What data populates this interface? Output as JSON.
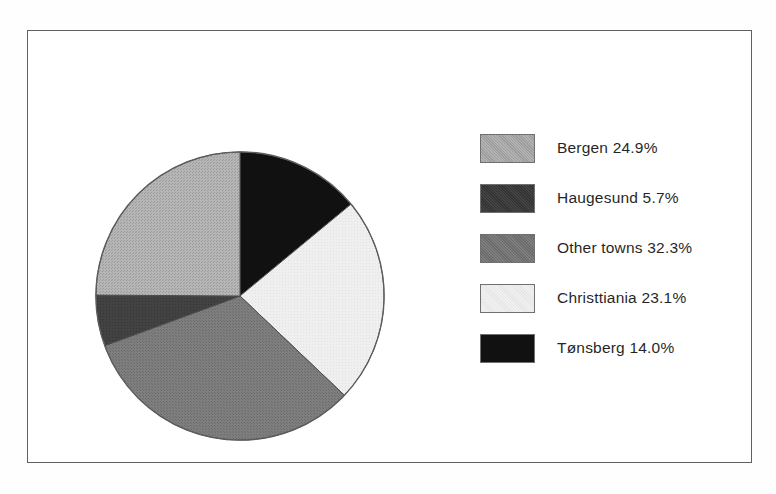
{
  "figure": {
    "frame": {
      "visible": true,
      "border_color": "#5d5d5d"
    },
    "background_color": "#ffffff"
  },
  "chart_data": {
    "type": "pie",
    "title": "",
    "subtitle": "",
    "xlabel": "",
    "ylabel": "",
    "grid": false,
    "legend_position": "right",
    "start_angle_deg": 0,
    "direction": "clockwise",
    "categories": [
      "Bergen",
      "Haugesund",
      "Other towns",
      "Christtiania",
      "Tønsberg"
    ],
    "values": [
      24.9,
      5.7,
      32.3,
      23.1,
      14.0
    ],
    "unit": "%",
    "slice_order_clockwise_from_top": [
      "Tønsberg",
      "Christtiania",
      "Other towns",
      "Haugesund",
      "Bergen"
    ],
    "colors": {
      "Bergen": "#a9a9a9",
      "Haugesund": "#3a3a3a",
      "Other towns": "#747474",
      "Christtiania": "#ededed",
      "Tønsberg": "#0d0d0d"
    },
    "slices": [
      {
        "label": "Bergen",
        "value": 24.9,
        "display": "Bergen 24.9%",
        "color": "#a9a9a9",
        "swatch_border": "#6e6e6e"
      },
      {
        "label": "Haugesund",
        "value": 5.7,
        "display": "Haugesund 5.7%",
        "color": "#3a3a3a",
        "swatch_border": "#6e6e6e"
      },
      {
        "label": "Other towns",
        "value": 32.3,
        "display": "Other towns 32.3%",
        "color": "#747474",
        "swatch_border": "#6e6e6e"
      },
      {
        "label": "Christtiania",
        "value": 23.1,
        "display": "Christtiania 23.1%",
        "color": "#ededed",
        "swatch_border": "#6e6e6e"
      },
      {
        "label": "Tønsberg",
        "value": 14.0,
        "display": "Tønsberg 14.0%",
        "color": "#0d0d0d",
        "swatch_border": "#6e6e6e"
      }
    ]
  },
  "legend": {
    "entries": [
      {
        "label": "Bergen 24.9%"
      },
      {
        "label": "Haugesund 5.7%"
      },
      {
        "label": "Other towns 32.3%"
      },
      {
        "label": "Christtiania 23.1%"
      },
      {
        "label": "Tønsberg 14.0%"
      }
    ]
  }
}
